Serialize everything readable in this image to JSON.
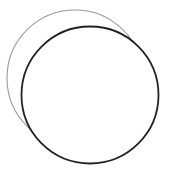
{
  "canvas": {
    "width": 171,
    "height": 173,
    "background": "#ffffff"
  },
  "shapes": [
    {
      "name": "light-circle",
      "cx": 75,
      "cy": 78,
      "r": 68,
      "stroke": "#9a9a9a",
      "stroke_width": 1.1,
      "fill": "none"
    },
    {
      "name": "dark-circle",
      "cx": 90,
      "cy": 95,
      "r": 68.5,
      "stroke": "#222222",
      "stroke_width": 1.8,
      "fill": "#ffffff"
    }
  ]
}
